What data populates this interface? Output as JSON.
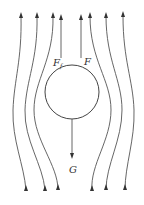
{
  "diagram": {
    "labels": {
      "drag_force_main": "F",
      "drag_force_sub": "f",
      "buoyancy_force": "F",
      "gravity": "G"
    },
    "circle": {
      "cx": 72,
      "cy": 92,
      "r": 27
    },
    "colors": {
      "stroke": "#555555",
      "arrow": "#333333",
      "background": "#ffffff"
    }
  }
}
